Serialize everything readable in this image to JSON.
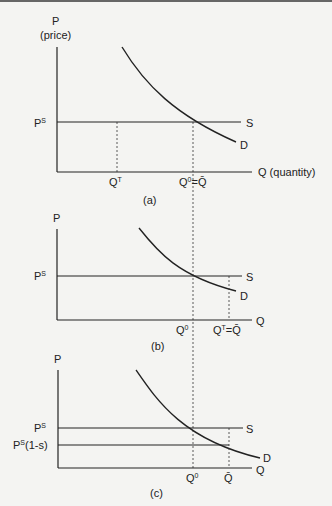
{
  "figure": {
    "panels": [
      {
        "id": "a",
        "caption": "(a)",
        "y_axis_label": "P",
        "y_axis_sublabel": "(price)",
        "x_axis_label": "Q (quantity)",
        "price_label_base": "P",
        "price_label_sup": "S",
        "supply_label": "S",
        "demand_label": "D",
        "q_left_base": "Q",
        "q_left_sup": "T",
        "q_right_base": "Q",
        "q_right_sup": "0",
        "q_right_suffix": "=Q̄"
      },
      {
        "id": "b",
        "caption": "(b)",
        "y_axis_label": "P",
        "x_axis_label": "Q",
        "price_label_base": "P",
        "price_label_sup": "S",
        "supply_label": "S",
        "demand_label": "D",
        "q_left_base": "Q",
        "q_left_sup": "0",
        "q_right_base": "Q",
        "q_right_sup": "T",
        "q_right_suffix": "=Q̄"
      },
      {
        "id": "c",
        "caption": "(c)",
        "y_axis_label": "P",
        "x_axis_label": "Q",
        "price_label_base": "P",
        "price_label_sup": "S",
        "subsidy_price_base": "P",
        "subsidy_price_sup": "S",
        "subsidy_price_suffix": "(1-s)",
        "supply_label": "S",
        "demand_label": "D",
        "q_left_base": "Q",
        "q_left_sup": "0",
        "q_right_label": "Q̄"
      }
    ],
    "colors": {
      "line": "#222222",
      "background": "#f4f4f2"
    }
  }
}
